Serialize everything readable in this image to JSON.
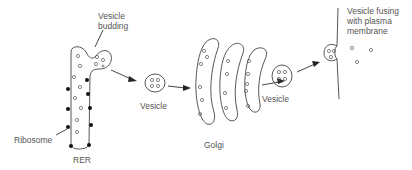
{
  "diagram": {
    "labels": {
      "vesicle_budding": "Vesicle\nbudding",
      "ribosome": "Ribosome",
      "rer": "RER",
      "vesicle_1": "Vesicle",
      "golgi": "Golgi",
      "vesicle_2": "Vesicle",
      "vesicle_fusing": "Vesicle fusing\nwith plasma\nmembrane"
    },
    "components": [
      {
        "id": "rer",
        "name": "Rough endoplasmic reticulum"
      },
      {
        "id": "ribosomes",
        "name": "Ribosomes",
        "count": 10
      },
      {
        "id": "budding-vesicle",
        "name": "Vesicle budding from RER"
      },
      {
        "id": "vesicle-1",
        "name": "Transport vesicle"
      },
      {
        "id": "golgi",
        "name": "Golgi cisternae",
        "count": 3
      },
      {
        "id": "vesicle-2",
        "name": "Secretory vesicle"
      },
      {
        "id": "plasma-membrane",
        "name": "Plasma membrane with fusing vesicle"
      }
    ],
    "flow": [
      "RER",
      "Vesicle",
      "Golgi",
      "Vesicle",
      "Plasma membrane"
    ],
    "colors": {
      "line": "#444444",
      "text": "#555555",
      "ribosome": "#111111",
      "background": "#ffffff"
    }
  }
}
